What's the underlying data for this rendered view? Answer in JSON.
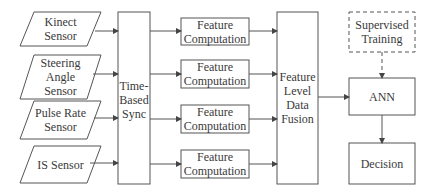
{
  "diagram": {
    "sensors": [
      {
        "label": "Kinect\nSensor"
      },
      {
        "label": "Steering\nAngle\nSensor"
      },
      {
        "label": "Pulse Rate\nSensor"
      },
      {
        "label": "IS Sensor"
      }
    ],
    "sync": {
      "label": "Time-\nBased\nSync"
    },
    "features": [
      {
        "label": "Feature\nComputation"
      },
      {
        "label": "Feature\nComputation"
      },
      {
        "label": "Feature\nComputation"
      },
      {
        "label": "Feature\nComputation"
      }
    ],
    "fusion": {
      "label": "Feature\nLevel\nData\nFusion"
    },
    "training": {
      "label": "Supervised\nTraining"
    },
    "ann": {
      "label": "ANN"
    },
    "decision": {
      "label": "Decision"
    },
    "colors": {
      "stroke": "#555555",
      "text": "#3a3a3a",
      "background": "#ffffff"
    }
  }
}
